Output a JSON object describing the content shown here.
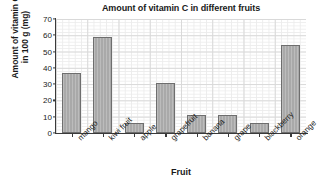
{
  "chart_data": {
    "type": "bar",
    "title": "Amount of vitamin C in different fruits",
    "xlabel": "Fruit",
    "ylabel_line1": "Amount of vitamin C",
    "ylabel_line2": "in 100 g (mg)",
    "categories": [
      "mango",
      "kiwi fruit",
      "apple",
      "grapefruit",
      "banana",
      "grape",
      "blackberry",
      "orange"
    ],
    "values": [
      37,
      59,
      6,
      31,
      11,
      11,
      6,
      54
    ],
    "ylim": [
      0,
      70
    ],
    "ytick_labels": [
      "0",
      "10",
      "20",
      "30",
      "40",
      "50",
      "60",
      "70"
    ],
    "ytick_values": [
      0,
      10,
      20,
      30,
      40,
      50,
      60,
      70
    ],
    "grid": "major and minor gridlines shown",
    "legend": "none",
    "bar_color": "#a9a9a9",
    "bar_edge_color": "#6e6e6e",
    "grid_major_color": "#d9d9d9",
    "grid_minor_color": "#ececec",
    "axis_color": "#3a3a3a",
    "text_color": "#1a1a1a"
  }
}
